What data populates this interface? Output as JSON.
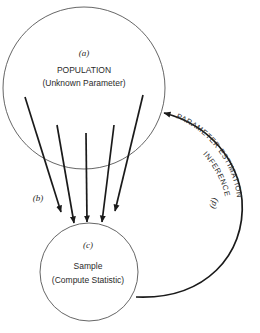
{
  "diagram": {
    "population": {
      "tag": "(a)",
      "title": "POPULATION",
      "subtitle": "(Unknown Parameter)"
    },
    "sampling": {
      "tag": "(b)",
      "arrow_count": 5
    },
    "sample": {
      "tag": "(c)",
      "title": "Sample",
      "subtitle": "(Compute Statistic)"
    },
    "inference": {
      "tag": "(d)",
      "line1": "INFERENCE",
      "line2": "PARAMETER ESTIMATION"
    },
    "colors": {
      "stroke": "#1a1a1a",
      "circle": "#555555",
      "background": "#ffffff"
    }
  }
}
